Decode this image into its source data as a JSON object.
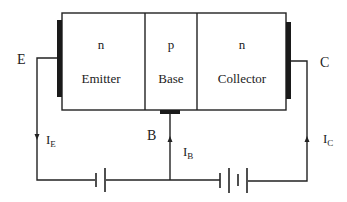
{
  "diagram": {
    "colors": {
      "line": "#222222",
      "contact": "#1a1a1a",
      "background": "#ffffff"
    },
    "regions": [
      {
        "type_letter": "n",
        "name": "Emitter"
      },
      {
        "type_letter": "p",
        "name": "Base"
      },
      {
        "type_letter": "n",
        "name": "Collector"
      }
    ],
    "terminals": {
      "emitter": "E",
      "base": "B",
      "collector": "C"
    },
    "currents": {
      "emitter": {
        "main": "I",
        "sub": "E",
        "direction": "down"
      },
      "base": {
        "main": "I",
        "sub": "B",
        "direction": "up"
      },
      "collector": {
        "main": "I",
        "sub": "C",
        "direction": "up"
      }
    },
    "batteries": [
      {
        "name": "emitter-base-battery",
        "cells": 1
      },
      {
        "name": "collector-base-battery",
        "cells": 2
      }
    ]
  }
}
